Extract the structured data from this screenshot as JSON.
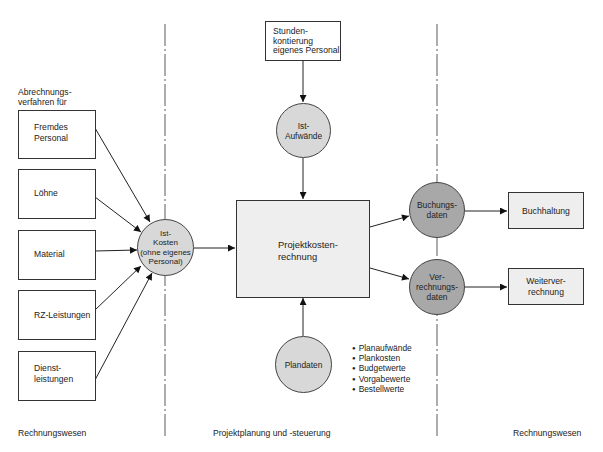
{
  "diagram": {
    "type": "flowchart",
    "zones": [
      {
        "id": "left",
        "label": "Rechnungswesen"
      },
      {
        "id": "center",
        "label": "Projektplanung und -steuerung"
      },
      {
        "id": "right",
        "label": "Rechnungswesen"
      }
    ],
    "left_heading": "Abrechnungs-\nverfahren für",
    "source_boxes": [
      {
        "id": "fremdes-personal",
        "label": "Fremdes\nPersonal"
      },
      {
        "id": "loehne",
        "label": "Löhne"
      },
      {
        "id": "material",
        "label": "Material"
      },
      {
        "id": "rz-leistungen",
        "label": "RZ-Leistungen"
      },
      {
        "id": "dienstleistungen",
        "label": "Dienst-\nleistungen"
      }
    ],
    "ist_kosten": {
      "label": "Ist-\nKosten\n(ohne eigenes\nPersonal)"
    },
    "stundenkontierung": {
      "label": "Stunden-\nkontierung\neigenes Personal"
    },
    "ist_aufwaende": {
      "label": "Ist-\nAufwände"
    },
    "projektkostenrechnung": {
      "label": "Projektkosten-\nrechnung"
    },
    "plandaten": {
      "label": "Plandaten"
    },
    "plandaten_items": [
      "Planaufwände",
      "Plankosten",
      "Budgetwerte",
      "Vorgabewerte",
      "Bestellwerte"
    ],
    "buchungsdaten": {
      "label": "Buchungs-\ndaten"
    },
    "verrechnungsdaten": {
      "label": "Ver-\nrechnungs-\ndaten"
    },
    "buchhaltung": {
      "label": "Buchhaltung"
    },
    "weiterverrechnung": {
      "label": "Weiterver-\nrechnung"
    },
    "edges": [
      [
        "Fremdes Personal",
        "Ist-Kosten"
      ],
      [
        "Löhne",
        "Ist-Kosten"
      ],
      [
        "Material",
        "Ist-Kosten"
      ],
      [
        "RZ-Leistungen",
        "Ist-Kosten"
      ],
      [
        "Dienstleistungen",
        "Ist-Kosten"
      ],
      [
        "Ist-Kosten",
        "Projektkostenrechnung"
      ],
      [
        "Stundenkontierung eigenes Personal",
        "Ist-Aufwände"
      ],
      [
        "Ist-Aufwände",
        "Projektkostenrechnung"
      ],
      [
        "Plandaten",
        "Projektkostenrechnung"
      ],
      [
        "Projektkostenrechnung",
        "Buchungsdaten"
      ],
      [
        "Projektkostenrechnung",
        "Verrechnungsdaten"
      ],
      [
        "Buchungsdaten",
        "Buchhaltung"
      ],
      [
        "Verrechnungsdaten",
        "Weiterverrechnung"
      ]
    ],
    "colors": {
      "light_circle": "#d8d8d8",
      "dark_circle": "#a8a8a8",
      "gray_box": "#eeeeee",
      "line": "#222222"
    }
  }
}
